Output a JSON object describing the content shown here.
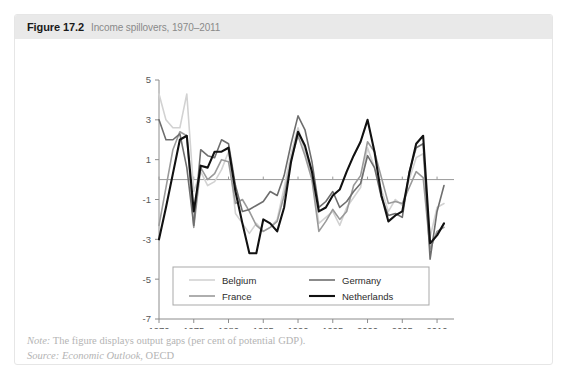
{
  "figure": {
    "number": "Figure 17.2",
    "caption": "Income spillovers, 1970–2011"
  },
  "footnotes": {
    "note_lead": "Note:",
    "note_text": " The figure displays output gaps (per cent of potential GDP).",
    "source_lead": "Source:",
    "source_italic": " Economic Outlook",
    "source_rest": ", OECD"
  },
  "colors": {
    "belgium": "#d2d2d2",
    "france": "#9a9a9a",
    "germany": "#6e6e6e",
    "netherlands": "#111111",
    "axis": "#8c8c8c",
    "zero_line": "#9a9a9a",
    "header_band": "#e9e9e9",
    "panel_border": "#e6e6e6",
    "footnote_text": "#b4b4b4"
  },
  "chart_data": {
    "type": "line",
    "title": "Income spillovers, 1970–2011",
    "xlabel": "",
    "ylabel": "",
    "xlim": [
      1970,
      2011
    ],
    "ylim": [
      -7,
      5
    ],
    "yticks": [
      5,
      3,
      1,
      -1,
      -3,
      -5,
      -7
    ],
    "xticks": [
      1970,
      1975,
      1980,
      1985,
      1990,
      1995,
      2000,
      2005,
      2010
    ],
    "grid": false,
    "zero_line": true,
    "legend_position": "bottom-center",
    "x": [
      1970,
      1971,
      1972,
      1973,
      1974,
      1975,
      1976,
      1977,
      1978,
      1979,
      1980,
      1981,
      1982,
      1983,
      1984,
      1985,
      1986,
      1987,
      1988,
      1989,
      1990,
      1991,
      1992,
      1993,
      1994,
      1995,
      1996,
      1997,
      1998,
      1999,
      2000,
      2001,
      2002,
      2003,
      2004,
      2005,
      2006,
      2007,
      2008,
      2009,
      2010,
      2011
    ],
    "series": [
      {
        "name": "Belgium",
        "color": "#d2d2d2",
        "width": 1.6,
        "values": [
          4.3,
          3.0,
          2.6,
          2.6,
          4.3,
          -0.6,
          0.4,
          -0.3,
          -0.1,
          0.5,
          1.4,
          -1.7,
          -2.2,
          -2.7,
          -2.2,
          -2.6,
          -2.4,
          -2.0,
          -0.4,
          1.3,
          2.6,
          1.4,
          0.1,
          -2.2,
          -1.9,
          -1.6,
          -2.3,
          -1.4,
          -0.9,
          -0.4,
          1.6,
          0.6,
          -0.5,
          -1.6,
          -1.0,
          -1.3,
          0.0,
          1.1,
          1.3,
          -2.9,
          -1.4,
          -1.2
        ]
      },
      {
        "name": "France",
        "color": "#9a9a9a",
        "width": 1.6,
        "values": [
          -2.3,
          -0.4,
          1.5,
          2.4,
          2.2,
          -2.4,
          0.6,
          0.0,
          0.3,
          1.0,
          0.9,
          -1.2,
          -1.0,
          -1.6,
          -2.3,
          -2.6,
          -2.4,
          -2.1,
          -0.8,
          1.0,
          2.2,
          1.2,
          0.0,
          -2.6,
          -2.1,
          -1.5,
          -2.0,
          -1.6,
          -0.3,
          0.2,
          1.9,
          1.4,
          0.1,
          -1.2,
          -1.1,
          -1.2,
          -0.4,
          0.4,
          0.1,
          -3.5,
          -2.6,
          -2.4
        ]
      },
      {
        "name": "Germany",
        "color": "#6e6e6e",
        "width": 1.6,
        "values": [
          3.0,
          2.0,
          2.0,
          2.3,
          0.6,
          -2.3,
          1.5,
          1.2,
          1.1,
          2.0,
          1.8,
          -0.3,
          -1.6,
          -1.5,
          -1.3,
          -1.1,
          -0.6,
          -0.8,
          0.2,
          1.8,
          3.2,
          2.5,
          0.9,
          -1.4,
          -1.1,
          -0.6,
          -1.4,
          -1.1,
          -0.6,
          -0.2,
          1.2,
          0.6,
          -0.9,
          -1.8,
          -1.7,
          -1.9,
          0.4,
          1.6,
          1.8,
          -4.0,
          -1.6,
          -0.3
        ]
      },
      {
        "name": "Netherlands",
        "color": "#111111",
        "width": 2.1,
        "values": [
          -3.0,
          -1.4,
          0.3,
          2.0,
          2.2,
          -1.6,
          0.7,
          0.6,
          1.4,
          1.4,
          1.6,
          -0.6,
          -2.2,
          -3.7,
          -3.7,
          -2.0,
          -2.2,
          -2.6,
          -1.4,
          0.9,
          2.4,
          1.7,
          0.4,
          -1.6,
          -1.4,
          -0.8,
          -0.5,
          0.4,
          1.2,
          1.9,
          3.0,
          1.4,
          -0.8,
          -2.1,
          -1.8,
          -1.6,
          0.3,
          1.8,
          2.2,
          -3.2,
          -2.8,
          -2.2
        ]
      }
    ]
  },
  "legend": {
    "entries": [
      {
        "label": "Belgium",
        "color": "#d2d2d2"
      },
      {
        "label": "Germany",
        "color": "#6e6e6e"
      },
      {
        "label": "France",
        "color": "#9a9a9a"
      },
      {
        "label": "Netherlands",
        "color": "#111111"
      }
    ]
  }
}
